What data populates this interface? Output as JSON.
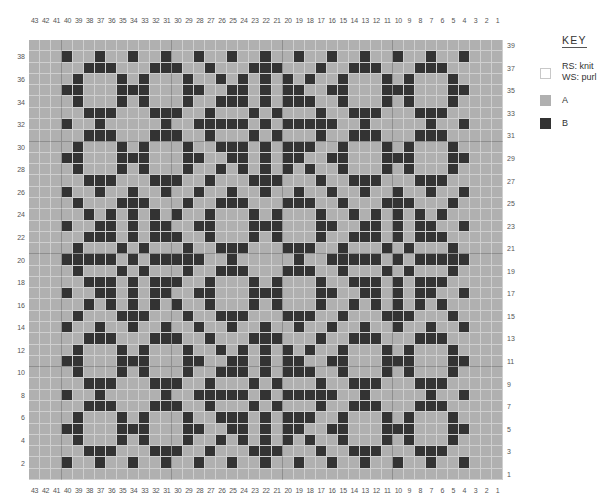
{
  "chart_data": {
    "type": "heatmap",
    "columns": 43,
    "rows": 39,
    "column_labels": [
      43,
      42,
      41,
      40,
      39,
      38,
      37,
      36,
      35,
      34,
      33,
      32,
      31,
      30,
      29,
      28,
      27,
      26,
      25,
      24,
      23,
      22,
      21,
      20,
      19,
      18,
      17,
      16,
      15,
      14,
      13,
      12,
      11,
      10,
      9,
      8,
      7,
      6,
      5,
      4,
      3,
      2,
      1
    ],
    "left_row_labels": [
      38,
      36,
      34,
      32,
      30,
      28,
      26,
      24,
      22,
      20,
      18,
      16,
      14,
      12,
      10,
      8,
      6,
      4,
      2
    ],
    "right_row_labels": [
      39,
      37,
      35,
      33,
      31,
      29,
      27,
      25,
      23,
      21,
      19,
      17,
      15,
      13,
      11,
      9,
      7,
      5,
      3,
      1
    ],
    "legend": [
      {
        "symbol": "white",
        "label": "RS: knit\nWS: purl"
      },
      {
        "symbol": "A",
        "label": "A"
      },
      {
        "symbol": "B",
        "label": "B"
      }
    ],
    "colors": {
      "A": "#b0b0b0",
      "B": "#333333",
      "blank": "#ffffff"
    },
    "note": "Rows listed top (row 39) to bottom (row 1); each string lists columns 43→1; 'B' = contrast color B, '.' = color A",
    "grid": [
      "...........................................",
      "...B..B..B..B..B..B..B..B..B..B..B..B..B...",
      ".....BBB...BBB..B...BBB...B..BBB...BBB.....",
      "....B...B.B...B..B.B.B.B.B..B...B.B...B....",
      "...BB...BBB...BB..BB.B.BB..BB...BBB...BB...",
      "....B...B.B...B..BBB.B.BBB..B...B.B...B....",
      ".....BBB...BBB..B...B.B...B..BBB...BBB.....",
      "...B..B.....B..BBBBB.B.BBBBB..B.....B..B...",
      ".....BBB...BBB..B...B.B...B..BBB...BBB.....",
      "....B...B.B...B..BBB.B.BBB..B...B.B...B....",
      "...BB...BBB...BB..BB.B.BB..BB...BBB...BB...",
      "....B...B.B...B..B.B.B.B.B..B...B.B...B....",
      ".....BBB...BBB..B...BBB...B..BBB...BBB.....",
      "...B..B..B..B..B..B..B..B..B..B..B..B..B...",
      "....B...BBB...B..BBB...BBB..B...BBB...B....",
      ".....B.B.B.B.B..B...B.B...B..B.B.B.B.B.....",
      "...B..BB.B.BB..BB...BBB...BB..BB.B.BB..B...",
      ".....BBB.B.BBB..B...B.B...B..BBB.B.BBB.....",
      "....B...B.B...B..BBB...BBB..B...B.B...B....",
      "...BBBBB.B.BBBBB..B.....B..BBBBB.B.BBBBB...",
      "....B...B.B...B..BBB...BBB..B...B.B...B....",
      ".....BBB.B.BBB..B...B.B...B..BBB.B.BBB.....",
      "...B..BB.B.BB..BB...BBB...BB..BB.B.BB..B...",
      ".....B.B.B.B.B..B...B.B...B..B.B.B.B.B.....",
      "....B...BBB...B..BBB...BBB..B...BBB...B....",
      "...B..B..B..B..B..B..B..B..B..B..B..B..B...",
      ".....BBB...BBB..B...BBB...B..BBB...BBB.....",
      "....B...B.B...B..B.B.B.B.B..B...B.B...B....",
      "...BB...BBB...BB..BB.B.BB..BB...BBB...BB...",
      "....B...B.B...B..BBB.B.BBB..B...B.B...B....",
      ".....BBB...BBB..B...B.B...B..BBB...BBB.....",
      "...B..B.....B..BBBBB.B.BBBBB..B.....B..B...",
      ".....BBB...BBB..B...B.B...B..BBB...BBB.....",
      "....B...B.B...B..BBB.B.BBB..B...B.B...B....",
      "...BB...BBB...BB..BB.B.BB..BB...BBB...BB...",
      "....B...B.B...B..B.B.B.B.B..B...B.B...B....",
      ".....BBB...BBB..B...BBB...B..BBB...BBB.....",
      "...B..B..B..B..B..B..B..B..B..B..B..B..B...",
      "..........................................."
    ]
  },
  "key": {
    "title": "KEY",
    "items": [
      {
        "swatch": "white",
        "line1": "RS: knit",
        "line2": "WS: purl"
      },
      {
        "swatch": "a",
        "line1": "A"
      },
      {
        "swatch": "b",
        "line1": "B"
      }
    ]
  }
}
